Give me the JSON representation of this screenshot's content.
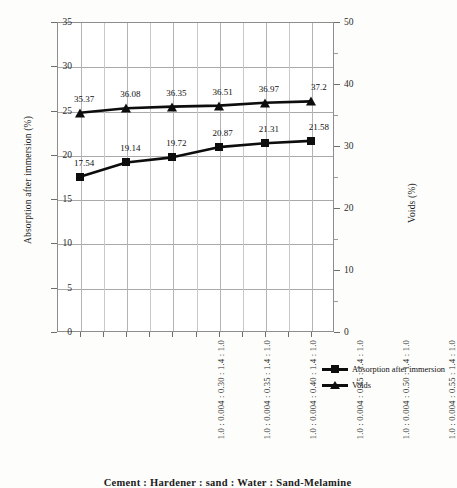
{
  "chart_data": {
    "type": "line",
    "title": "",
    "xlabel": "Cement : Hardener : sand : Water : Sand-Melamine",
    "categories": [
      "1.0 : 0.004 : 0.30 : 1.4 : 1.0",
      "1.0 : 0.004 : 0.35 : 1.4 : 1.0",
      "1.0 : 0.004 : 0.40 : 1.4 : 1.0",
      "1.0 : 0.004 : 0.45 : 1.4 : 1.0",
      "1.0 : 0.004 : 0.50 : 1.4 : 1.0",
      "1.0 : 0.004 : 0.55 : 1.4 : 1.0"
    ],
    "series": [
      {
        "name": "Absorption after immersion",
        "axis": "left",
        "marker": "square",
        "values": [
          17.54,
          19.14,
          19.72,
          20.87,
          21.31,
          21.58
        ],
        "labels": [
          "17.54",
          "19.14",
          "19.72",
          "20.87",
          "21.31",
          "21.58"
        ]
      },
      {
        "name": "Voids",
        "axis": "right",
        "marker": "triangle",
        "values": [
          35.37,
          36.08,
          36.35,
          36.51,
          36.97,
          37.2
        ],
        "labels": [
          "35.37",
          "36.08",
          "36.35",
          "36.51",
          "36.97",
          "37.2"
        ]
      }
    ],
    "y_left": {
      "label": "Absorption after immersion (%)",
      "min": 0,
      "max": 35,
      "step": 5,
      "ticks": [
        "0",
        "5",
        "10",
        "15",
        "20",
        "25",
        "30",
        "35"
      ]
    },
    "y_right": {
      "label": "Voids (%)",
      "min": 0,
      "max": 50,
      "step": 10,
      "ticks": [
        "0",
        "10",
        "20",
        "30",
        "40",
        "50"
      ]
    },
    "grid": true,
    "legend_position": "right",
    "series_color": "#0d0d0d"
  }
}
